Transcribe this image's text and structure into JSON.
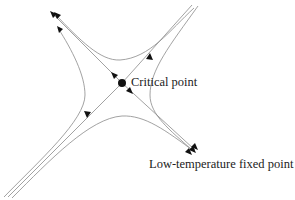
{
  "diagram": {
    "type": "renormalization-group flow diagram",
    "nodes": [
      {
        "id": "critical",
        "label": "Critical point",
        "kind": "filled-dot",
        "x": 122,
        "y": 83
      },
      {
        "id": "lowtemp",
        "label": "Low-temperature fixed point",
        "kind": "arrow-sink",
        "x": 195,
        "y": 150
      }
    ],
    "separatrices": [
      {
        "from": "top-right",
        "to": "bottom-left",
        "direction": "inward toward critical point"
      },
      {
        "from": "critical",
        "to": "top-left",
        "direction": "outward"
      },
      {
        "from": "critical",
        "to": "bottom-right",
        "direction": "outward toward low-temperature fixed point"
      }
    ],
    "flow_curves": 4,
    "colors": {
      "lines": "#8a8a8a",
      "arrows": "#111111",
      "text": "#222222"
    }
  },
  "labels": {
    "critical_point": "Critical point",
    "low_temperature_fixed_point": "Low-temperature fixed point"
  }
}
